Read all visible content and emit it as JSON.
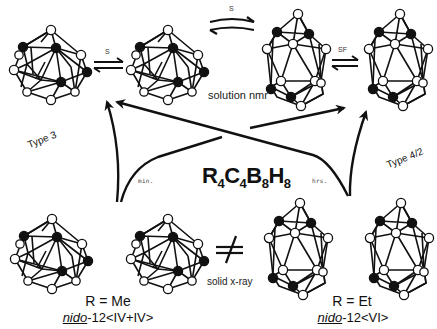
{
  "diagram": {
    "formula": {
      "R": "R",
      "r_sub": "4",
      "C": "C",
      "c_sub": "4",
      "B": "B",
      "b_sub": "8",
      "H": "H",
      "h_sub": "8"
    },
    "labels": {
      "type_left": "Type 3",
      "type_right": "Type 4/2",
      "solution_nmr": "solution nmr",
      "solid_xray": "solid x-ray",
      "min": "min.",
      "hrs": "hrs.",
      "eq_s1": "S",
      "eq_s2": "S",
      "eq_sf": "SF",
      "not_equal": "≠"
    },
    "bottom_left": {
      "r_label": "R = Me",
      "nido_prefix": "nido",
      "nido_suffix": "-12<IV+IV>"
    },
    "bottom_right": {
      "r_label": "R = Et",
      "nido_prefix": "nido",
      "nido_suffix": "-12<VI>"
    },
    "clusters": [
      {
        "id": "top-1",
        "shape": "icosahedral",
        "position": "top-left"
      },
      {
        "id": "top-2",
        "shape": "icosahedral",
        "position": "top-center-left"
      },
      {
        "id": "top-3",
        "shape": "elongated",
        "position": "top-center-right"
      },
      {
        "id": "top-4",
        "shape": "elongated",
        "position": "top-right"
      },
      {
        "id": "bottom-1",
        "shape": "icosahedral",
        "position": "bottom-left"
      },
      {
        "id": "bottom-2",
        "shape": "icosahedral",
        "position": "bottom-center-left"
      },
      {
        "id": "bottom-3",
        "shape": "elongated",
        "position": "bottom-center-right"
      },
      {
        "id": "bottom-4",
        "shape": "elongated",
        "position": "bottom-right"
      }
    ],
    "colors": {
      "ink": "#111111",
      "open_atom": "#ffffff",
      "filled_atom": "#111111",
      "background": "#ffffff"
    }
  }
}
